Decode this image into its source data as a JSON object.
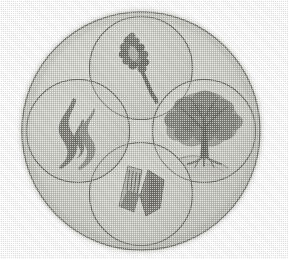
{
  "image": {
    "kind": "emblem",
    "title": "Circular emblem with four overlapping symbol roundels",
    "alt_text": "Grey halftone printed circular emblem containing four overlapping circles, each holding a symbol: an ear of wheat, a tree, two stone tablets, and a flame",
    "medium": "halftone print scan",
    "width_px": 288,
    "height_px": 259
  },
  "palette": {
    "page_background": "#ffffff",
    "disc_fill": "#c9c9c4",
    "disc_fill_light": "#d5d5d0",
    "roundel_fill": "#c2c2bd",
    "outline": "#6d6d68",
    "outline_soft": "#8a8a85",
    "symbol_dark": "#6a6a64",
    "symbol_mid": "#8b8b85",
    "symbol_light": "#a9a9a3",
    "shadow_edge": "#b4b4ae"
  },
  "geometry": {
    "main_disc": {
      "cx": 141,
      "cy": 131,
      "r": 120
    },
    "roundel_radius": 52,
    "roundel_offset": 63
  },
  "main_disc": {
    "label": "outer disc",
    "name": "main-disc"
  },
  "roundels": [
    {
      "id": "top",
      "position_label": "top",
      "symbol": "wheat-ear",
      "symbol_label": "Ear of wheat",
      "cx": 141,
      "cy": 68
    },
    {
      "id": "right",
      "position_label": "right",
      "symbol": "tree",
      "symbol_label": "Tree",
      "cx": 204,
      "cy": 131
    },
    {
      "id": "bottom",
      "position_label": "bottom",
      "symbol": "stone-tablets",
      "symbol_label": "Stone tablets",
      "cx": 141,
      "cy": 194
    },
    {
      "id": "left",
      "position_label": "left",
      "symbol": "flame",
      "symbol_label": "Flame",
      "cx": 78,
      "cy": 131
    }
  ]
}
